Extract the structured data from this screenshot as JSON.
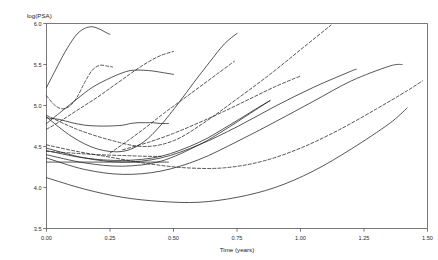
{
  "chart_data": {
    "type": "line",
    "title": "",
    "subtitle": "",
    "xlabel": "Time (years)",
    "ylabel": "log(PSA)",
    "xlim": [
      0.0,
      1.5
    ],
    "ylim": [
      3.5,
      6.0
    ],
    "xticks": [
      "0.00",
      "0.25",
      "0.50",
      "0.75",
      "1.00",
      "1.25",
      "1.50"
    ],
    "xtick_values": [
      0.0,
      0.25,
      0.5,
      0.75,
      1.0,
      1.25,
      1.5
    ],
    "yticks": [
      "3.5",
      "4.0",
      "4.5",
      "5.0",
      "5.5",
      "6.0"
    ],
    "ytick_values": [
      3.5,
      4.0,
      4.5,
      5.0,
      5.5,
      6.0
    ],
    "grid": false,
    "legend": "none",
    "series": [
      {
        "name": "subject-01",
        "style": "solid",
        "x": [
          0.0,
          0.03,
          0.06,
          0.09,
          0.12,
          0.15,
          0.18,
          0.21,
          0.24,
          0.25
        ],
        "y": [
          5.22,
          5.4,
          5.58,
          5.74,
          5.87,
          5.94,
          5.96,
          5.93,
          5.88,
          5.87
        ]
      },
      {
        "name": "subject-02",
        "style": "dashed",
        "x": [
          0.0,
          0.03,
          0.06,
          0.09,
          0.12,
          0.15,
          0.18,
          0.21,
          0.24,
          0.26
        ],
        "y": [
          5.12,
          5.01,
          4.96,
          4.99,
          5.1,
          5.28,
          5.43,
          5.49,
          5.48,
          5.47
        ]
      },
      {
        "name": "subject-03",
        "style": "solid",
        "x": [
          0.0,
          0.05,
          0.1,
          0.15,
          0.2,
          0.25,
          0.3,
          0.33,
          0.36,
          0.39,
          0.42,
          0.45,
          0.48
        ],
        "y": [
          4.85,
          4.83,
          4.79,
          4.76,
          4.75,
          4.75,
          4.76,
          4.78,
          4.79,
          4.79,
          4.79,
          4.78,
          4.78
        ]
      },
      {
        "name": "subject-04",
        "style": "solid",
        "x": [
          0.0,
          0.06,
          0.12,
          0.18,
          0.24,
          0.3,
          0.34,
          0.38,
          0.42,
          0.46,
          0.5
        ],
        "y": [
          4.78,
          4.93,
          5.08,
          5.22,
          5.32,
          5.4,
          5.43,
          5.43,
          5.42,
          5.4,
          5.38
        ]
      },
      {
        "name": "subject-05",
        "style": "dashed",
        "x": [
          0.0,
          0.05,
          0.1,
          0.15,
          0.2,
          0.25,
          0.3,
          0.35,
          0.4,
          0.45,
          0.5
        ],
        "y": [
          4.71,
          4.8,
          4.9,
          5.0,
          5.1,
          5.21,
          5.32,
          5.43,
          5.53,
          5.61,
          5.66
        ]
      },
      {
        "name": "subject-06",
        "style": "solid",
        "x": [
          0.0,
          0.1,
          0.2,
          0.3,
          0.38,
          0.45,
          0.52,
          0.58,
          0.64,
          0.7,
          0.75
        ],
        "y": [
          4.86,
          4.62,
          4.47,
          4.44,
          4.55,
          4.76,
          5.03,
          5.28,
          5.52,
          5.75,
          5.88
        ]
      },
      {
        "name": "subject-07",
        "style": "dashed",
        "x": [
          0.25,
          0.32,
          0.39,
          0.46,
          0.53,
          0.6,
          0.67,
          0.74
        ],
        "y": [
          4.42,
          4.57,
          4.73,
          4.9,
          5.06,
          5.22,
          5.38,
          5.54
        ]
      },
      {
        "name": "subject-08",
        "style": "dashed",
        "x": [
          0.3,
          0.4,
          0.5,
          0.6,
          0.7,
          0.8,
          0.9,
          1.0
        ],
        "y": [
          4.46,
          4.55,
          4.66,
          4.79,
          4.93,
          5.08,
          5.23,
          5.36
        ]
      },
      {
        "name": "subject-09",
        "style": "dashed",
        "x": [
          0.0,
          0.12,
          0.25,
          0.38,
          0.5,
          0.62,
          0.75,
          0.88,
          1.0,
          1.12
        ],
        "y": [
          4.88,
          4.71,
          4.58,
          4.5,
          4.57,
          4.79,
          5.08,
          5.38,
          5.68,
          5.98
        ]
      },
      {
        "name": "subject-10",
        "style": "solid",
        "x": [
          0.0,
          0.15,
          0.3,
          0.45,
          0.6,
          0.72,
          0.82,
          0.88
        ],
        "y": [
          4.45,
          4.36,
          4.33,
          4.38,
          4.55,
          4.76,
          4.95,
          5.06
        ]
      },
      {
        "name": "subject-11",
        "style": "solid",
        "x": [
          0.0,
          0.15,
          0.3,
          0.45,
          0.6,
          0.75,
          0.9,
          1.05,
          1.2,
          1.22
        ],
        "y": [
          4.48,
          4.36,
          4.31,
          4.36,
          4.52,
          4.74,
          4.99,
          5.22,
          5.42,
          5.44
        ]
      },
      {
        "name": "subject-12",
        "style": "solid",
        "x": [
          0.0,
          0.15,
          0.3,
          0.45,
          0.6,
          0.7,
          0.8,
          0.88
        ],
        "y": [
          4.4,
          4.3,
          4.26,
          4.32,
          4.52,
          4.7,
          4.9,
          5.06
        ]
      },
      {
        "name": "subject-13",
        "style": "solid",
        "x": [
          0.0,
          0.2,
          0.38,
          0.48
        ],
        "y": [
          4.31,
          4.31,
          4.31,
          4.31
        ]
      },
      {
        "name": "subject-14",
        "style": "dashed",
        "x": [
          0.0,
          0.1,
          0.2,
          0.3,
          0.4,
          0.45
        ],
        "y": [
          4.44,
          4.42,
          4.4,
          4.39,
          4.38,
          4.38
        ]
      },
      {
        "name": "subject-15",
        "style": "dashed",
        "x": [
          0.0,
          0.12,
          0.25,
          0.4,
          0.55,
          0.7,
          0.85,
          1.0,
          1.15,
          1.3,
          1.42,
          1.48
        ],
        "y": [
          4.52,
          4.44,
          4.37,
          4.29,
          4.24,
          4.24,
          4.32,
          4.48,
          4.7,
          4.96,
          5.18,
          5.3
        ]
      },
      {
        "name": "subject-16",
        "style": "solid",
        "x": [
          0.0,
          0.15,
          0.3,
          0.45,
          0.6,
          0.75,
          0.9,
          1.05,
          1.2,
          1.35,
          1.4
        ],
        "y": [
          4.36,
          4.22,
          4.16,
          4.2,
          4.34,
          4.56,
          4.8,
          5.05,
          5.3,
          5.48,
          5.5
        ]
      },
      {
        "name": "subject-17",
        "style": "solid",
        "x": [
          0.0,
          0.15,
          0.3,
          0.45,
          0.6,
          0.75,
          0.9,
          1.05,
          1.2,
          1.35,
          1.42
        ],
        "y": [
          4.12,
          3.98,
          3.88,
          3.83,
          3.82,
          3.88,
          4.0,
          4.2,
          4.47,
          4.78,
          4.97
        ]
      }
    ]
  }
}
